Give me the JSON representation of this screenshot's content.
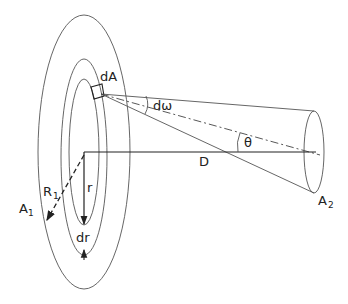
{
  "diagram": {
    "labels": {
      "dA": "dA",
      "domega": "dω",
      "theta": "θ",
      "D": "D",
      "r": "r",
      "dr": "dr",
      "R1_main": "R",
      "R1_sub": "1",
      "A1_main": "A",
      "A1_sub": "1",
      "A2_main": "A",
      "A2_sub": "2"
    },
    "shapes": {
      "outer_disk_A1": {
        "cx": 84,
        "cy": 152,
        "rx": 46,
        "ry": 137
      },
      "ring_outer": {
        "cx": 84,
        "cy": 158,
        "rx": 23,
        "ry": 98
      },
      "ring_inner": {
        "cx": 84,
        "cy": 152,
        "rx": 15,
        "ry": 73
      },
      "target_disk_A2": {
        "cx": 314,
        "cy": 152,
        "rx": 10,
        "ry": 41
      },
      "apex_dA": {
        "x": 101,
        "y": 94
      },
      "axis_D": {
        "x1": 84,
        "y1": 152,
        "x2": 314,
        "y2": 152
      }
    }
  }
}
